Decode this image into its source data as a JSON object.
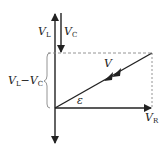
{
  "diagram": {
    "title": "",
    "type": "phasor-diagram",
    "colors": {
      "line": "#222222",
      "dashed": "#888888",
      "background": "#ffffff"
    },
    "labels": {
      "vl": {
        "main": "V",
        "sub": "L"
      },
      "vc": {
        "main": "V",
        "sub": "C"
      },
      "v": {
        "main": "V"
      },
      "vr": {
        "main": "V",
        "sub": "R"
      },
      "epsilon": "ε",
      "diff": {
        "a": "V",
        "a_sub": "L",
        "op": "−",
        "b": "V",
        "b_sub": "C"
      }
    }
  }
}
